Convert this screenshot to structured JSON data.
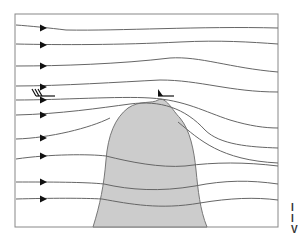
{
  "diagram": {
    "frame": {
      "x": 15,
      "y": 14,
      "width": 263,
      "height": 213,
      "stroke": "#888888"
    },
    "colors": {
      "background": "#ffffff",
      "mountain_fill": "#cccccc",
      "mountain_stroke": "#777777",
      "streamline": "#666666",
      "arrow": "#111111",
      "barb": "#111111"
    },
    "mountain": {
      "label": "mountain",
      "path": "M 93 227 C 100 205, 104 185, 106 160 C 108 135, 115 118, 128 108 C 140 100, 152 104, 158 100 C 166 96, 172 110, 180 118 C 190 130, 194 150, 196 170 C 198 190, 200 210, 207 227 Z"
    },
    "streamlines": [
      {
        "id": 1,
        "path": "M 16 25 C 30 26, 50 28, 66 30 C 120 31, 200 26, 278 28",
        "arrow": [
          43,
          28
        ]
      },
      {
        "id": 2,
        "path": "M 16 44 C 60 45, 120 45, 180 42 C 220 40, 250 42, 278 44",
        "arrow": [
          43,
          45
        ]
      },
      {
        "id": 3,
        "path": "M 16 66 C 60 66, 120 64, 170 58 C 200 56, 230 68, 278 72",
        "arrow": [
          43,
          66
        ]
      },
      {
        "id": 4,
        "path": "M 16 86 C 60 86, 120 82, 160 80 C 200 80, 230 92, 278 92",
        "arrow": [
          43,
          87
        ]
      },
      {
        "id": 5,
        "path": "M 16 100 C 60 100, 120 96, 150 98 C 185 100, 205 112, 230 120 C 250 126, 265 128, 278 128",
        "arrow": [
          43,
          100
        ]
      },
      {
        "id": 6,
        "path": "M 16 115 C 60 114, 100 108, 130 104 C 160 100, 185 108, 205 130 C 220 145, 250 147, 278 148",
        "arrow": [
          43,
          115
        ]
      },
      {
        "id": 7,
        "path": "M 16 139 C 50 138, 90 128, 110 118",
        "arrow": [
          43,
          138
        ]
      },
      {
        "id": 7.5,
        "path": "M 178 122 C 200 140, 220 160, 278 163",
        "arrow": null
      },
      {
        "id": 8,
        "path": "M 16 159 C 50 154, 90 154, 106 156 C 130 162, 160 168, 185 166 C 215 162, 245 162, 278 166",
        "arrow": [
          43,
          156
        ]
      },
      {
        "id": 9,
        "path": "M 16 182 C 50 182, 85 182, 104 184 C 130 190, 160 192, 195 186 C 225 180, 250 180, 278 184",
        "arrow": [
          43,
          182
        ]
      },
      {
        "id": 10,
        "path": "M 16 199 C 50 198, 85 198, 102 199 C 130 204, 160 210, 200 203 C 230 198, 255 197, 278 200",
        "arrow": [
          43,
          199
        ]
      }
    ],
    "wind_barbs": [
      {
        "name": "upstream-wind-barb",
        "x": 36,
        "y": 96,
        "shaft_length": 19,
        "barbs": 3
      },
      {
        "name": "summit-wind-barb",
        "x": 158,
        "y": 95,
        "shaft_length": 16,
        "pennant": true
      }
    ],
    "clipped_text_right": [
      "I",
      "I",
      "V"
    ]
  }
}
